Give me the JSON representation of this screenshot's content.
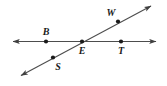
{
  "figure": {
    "type": "geometry-diagram",
    "background_color": "#ffffff",
    "stroke_color": "#4d4d4d",
    "point_color": "#1a1a1a",
    "label_color": "#1a1a1a",
    "stroke_width": 1.1,
    "point_radius": 2.1,
    "lines": [
      {
        "name": "horizontal-line",
        "id": "line-bet",
        "x1": 13,
        "y1": 41.5,
        "x2": 156,
        "y2": 41.5,
        "arrow_start": true,
        "arrow_end": true
      },
      {
        "name": "diagonal-line",
        "id": "line-swe",
        "x1": 21,
        "y1": 75.5,
        "x2": 151,
        "y2": 6,
        "arrow_start": true,
        "arrow_end": true
      }
    ],
    "points": [
      {
        "id": "B",
        "label": "B",
        "cx": 46,
        "cy": 41.5,
        "label_x": 46,
        "label_y": 35
      },
      {
        "id": "E",
        "label": "E",
        "cx": 82,
        "cy": 41.5,
        "label_x": 82,
        "label_y": 54
      },
      {
        "id": "T",
        "label": "T",
        "cx": 121,
        "cy": 41.5,
        "label_x": 121,
        "label_y": 54
      },
      {
        "id": "W",
        "label": "W",
        "cx": 118,
        "cy": 21.5,
        "label_x": 111,
        "label_y": 16
      },
      {
        "id": "S",
        "label": "S",
        "cx": 53,
        "cy": 57.5,
        "label_x": 58,
        "label_y": 70
      }
    ]
  }
}
